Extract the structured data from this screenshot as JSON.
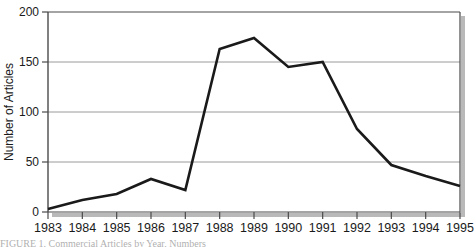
{
  "chart_data": {
    "type": "line",
    "title": "",
    "xlabel": "",
    "ylabel": "Number of Articles",
    "categories": [
      "1983",
      "1984",
      "1985",
      "1986",
      "1987",
      "1988",
      "1989",
      "1990",
      "1991",
      "1992",
      "1993",
      "1994",
      "1995"
    ],
    "values": [
      3,
      12,
      18,
      33,
      22,
      163,
      174,
      145,
      150,
      83,
      47,
      36,
      26
    ],
    "series": [
      {
        "name": "Number of Articles",
        "values": [
          3,
          12,
          18,
          33,
          22,
          163,
          174,
          145,
          150,
          83,
          47,
          36,
          26
        ]
      }
    ],
    "ylim": [
      0,
      200
    ],
    "yticks": [
      0,
      50,
      100,
      150,
      200
    ],
    "ytick_labels": [
      "0",
      "50",
      "100",
      "150",
      "200"
    ],
    "xlim": [
      "1983",
      "1995"
    ],
    "grid": "horizontal",
    "legend": "none",
    "line_color": "#1a1a1a",
    "gridline_color": "#999999",
    "frame_color": "#555555",
    "shadow_color": "#b5b5b5",
    "background": "#ffffff"
  },
  "caption": {
    "text": "FIGURE 1.   Commercial Articles by Year, Numbers"
  },
  "axes": {
    "y_title": "Number of Articles"
  }
}
